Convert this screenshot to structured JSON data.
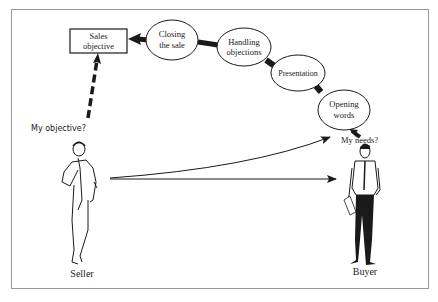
{
  "diagram": {
    "sales_objective_box": {
      "line1": "Sales",
      "line2": "objective"
    },
    "stages": [
      {
        "id": "closing",
        "line1": "Closing",
        "line2": "the sale"
      },
      {
        "id": "handling",
        "line1": "Handling",
        "line2": "objections"
      },
      {
        "id": "presentation",
        "line1": "Presentation",
        "line2": ""
      },
      {
        "id": "opening",
        "line1": "Opening",
        "line2": "words"
      }
    ],
    "seller_question": "My objective?",
    "buyer_question": "My needs?",
    "seller_label": "Seller",
    "buyer_label": "Buyer",
    "colors": {
      "ink": "#1a1a1a",
      "frame": "#9a9a9a",
      "background": "#ffffff"
    }
  }
}
